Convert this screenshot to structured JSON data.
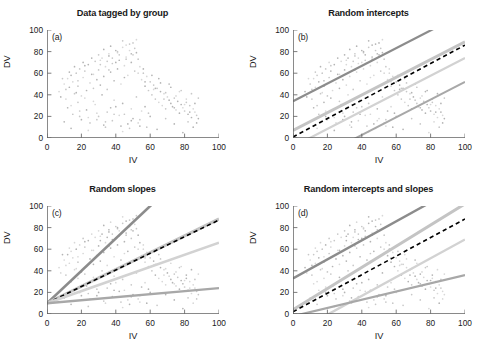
{
  "figure": {
    "width": 491,
    "height": 352,
    "background": "#ffffff"
  },
  "axes": {
    "xlabel": "IV",
    "ylabel": "DV",
    "xticks": [
      0,
      20,
      40,
      60,
      80,
      100
    ],
    "yticks": [
      0,
      20,
      40,
      60,
      80,
      100
    ],
    "xlim": [
      0,
      100
    ],
    "ylim": [
      0,
      100
    ],
    "grid": false
  },
  "colors": {
    "axis": "#5a5a5a",
    "text": "#1a1a1a",
    "pooled_line": "#000000",
    "group_dark": "#8c8c8c",
    "group_mid": "#a8a8a8",
    "group_light": "#c4c4c4",
    "group_lighter": "#d2d2d2",
    "point_dark": "#b4b4b4",
    "point_light": "#d8d8d8"
  },
  "panels": [
    {
      "key": "a",
      "tag": "(a)",
      "title": "Data tagged by group",
      "has_points": true,
      "lines": []
    },
    {
      "key": "b",
      "tag": "(b)",
      "title": "Random intercepts",
      "has_points": true,
      "lines": [
        {
          "name": "group-1",
          "intercept": 34,
          "slope": 0.82,
          "color": "#8c8c8c",
          "width": 2.2,
          "dashed": false
        },
        {
          "name": "group-2",
          "intercept": 7,
          "slope": 0.82,
          "color": "#c4c4c4",
          "width": 3.0,
          "dashed": false
        },
        {
          "name": "pooled",
          "intercept": 1,
          "slope": 0.85,
          "color": "#000000",
          "width": 1.6,
          "dashed": true
        },
        {
          "name": "group-3",
          "intercept": -8,
          "slope": 0.82,
          "color": "#d2d2d2",
          "width": 2.2,
          "dashed": false
        },
        {
          "name": "group-4",
          "intercept": -30,
          "slope": 0.82,
          "color": "#a8a8a8",
          "width": 2.0,
          "dashed": false
        }
      ]
    },
    {
      "key": "c",
      "tag": "(c)",
      "title": "Random slopes",
      "has_points": true,
      "lines": [
        {
          "name": "group-1",
          "intercept": 10,
          "slope": 1.5,
          "color": "#8c8c8c",
          "width": 2.6,
          "dashed": false
        },
        {
          "name": "group-2",
          "intercept": 10,
          "slope": 0.78,
          "color": "#c4c4c4",
          "width": 3.0,
          "dashed": false
        },
        {
          "name": "pooled",
          "intercept": 10,
          "slope": 0.77,
          "color": "#000000",
          "width": 1.6,
          "dashed": true
        },
        {
          "name": "group-3",
          "intercept": 10,
          "slope": 0.56,
          "color": "#d2d2d2",
          "width": 2.6,
          "dashed": false
        },
        {
          "name": "group-4",
          "intercept": 10,
          "slope": 0.14,
          "color": "#a8a8a8",
          "width": 2.4,
          "dashed": false
        }
      ]
    },
    {
      "key": "d",
      "tag": "(d)",
      "title": "Random intercepts and slopes",
      "has_points": true,
      "lines": [
        {
          "name": "group-1",
          "intercept": 33,
          "slope": 0.88,
          "color": "#8c8c8c",
          "width": 2.4,
          "dashed": false
        },
        {
          "name": "group-2",
          "intercept": 4,
          "slope": 0.98,
          "color": "#c4c4c4",
          "width": 3.0,
          "dashed": false
        },
        {
          "name": "pooled",
          "intercept": 2,
          "slope": 0.86,
          "color": "#000000",
          "width": 1.6,
          "dashed": true
        },
        {
          "name": "group-3",
          "intercept": -18,
          "slope": 0.87,
          "color": "#d2d2d2",
          "width": 2.4,
          "dashed": false
        },
        {
          "name": "group-4",
          "intercept": -2,
          "slope": 0.38,
          "color": "#a8a8a8",
          "width": 2.2,
          "dashed": false
        }
      ]
    }
  ],
  "chart_data": {
    "type": "scatter",
    "xlabel": "IV",
    "ylabel": "DV",
    "xlim": [
      0,
      100
    ],
    "ylim": [
      0,
      100
    ],
    "xticks": [
      0,
      20,
      40,
      60,
      80,
      100
    ],
    "yticks": [
      0,
      20,
      40,
      60,
      80,
      100
    ],
    "grid": false,
    "legend": "none",
    "subplots": [
      {
        "panel": "(a)",
        "title": "Data tagged by group",
        "series": [
          {
            "name": "observations",
            "type": "scatter",
            "n_points": 300
          }
        ]
      },
      {
        "panel": "(b)",
        "title": "Random intercepts",
        "series": [
          {
            "name": "group 1",
            "type": "line",
            "intercept": 34,
            "slope": 0.82
          },
          {
            "name": "group 2",
            "type": "line",
            "intercept": 7,
            "slope": 0.82
          },
          {
            "name": "pooled (dashed)",
            "type": "line",
            "intercept": 1,
            "slope": 0.85
          },
          {
            "name": "group 3",
            "type": "line",
            "intercept": -8,
            "slope": 0.82
          },
          {
            "name": "group 4",
            "type": "line",
            "intercept": -30,
            "slope": 0.82
          }
        ]
      },
      {
        "panel": "(c)",
        "title": "Random slopes",
        "series": [
          {
            "name": "group 1",
            "type": "line",
            "intercept": 10,
            "slope": 1.5
          },
          {
            "name": "group 2",
            "type": "line",
            "intercept": 10,
            "slope": 0.78
          },
          {
            "name": "pooled (dashed)",
            "type": "line",
            "intercept": 10,
            "slope": 0.77
          },
          {
            "name": "group 3",
            "type": "line",
            "intercept": 10,
            "slope": 0.56
          },
          {
            "name": "group 4",
            "type": "line",
            "intercept": 10,
            "slope": 0.14
          }
        ]
      },
      {
        "panel": "(d)",
        "title": "Random intercepts and slopes",
        "series": [
          {
            "name": "group 1",
            "type": "line",
            "intercept": 33,
            "slope": 0.88
          },
          {
            "name": "group 2",
            "type": "line",
            "intercept": 4,
            "slope": 0.98
          },
          {
            "name": "pooled (dashed)",
            "type": "line",
            "intercept": 2,
            "slope": 0.86
          },
          {
            "name": "group 3",
            "type": "line",
            "intercept": -18,
            "slope": 0.87
          },
          {
            "name": "group 4",
            "type": "line",
            "intercept": -2,
            "slope": 0.38
          }
        ]
      }
    ],
    "points": [
      [
        7,
        43
      ],
      [
        10,
        50
      ],
      [
        11,
        36
      ],
      [
        12,
        55
      ],
      [
        13,
        47
      ],
      [
        14,
        58
      ],
      [
        15,
        52
      ],
      [
        16,
        41
      ],
      [
        17,
        60
      ],
      [
        18,
        48
      ],
      [
        19,
        64
      ],
      [
        20,
        39
      ],
      [
        21,
        56
      ],
      [
        22,
        62
      ],
      [
        23,
        44
      ],
      [
        24,
        68
      ],
      [
        25,
        51
      ],
      [
        26,
        59
      ],
      [
        27,
        46
      ],
      [
        28,
        71
      ],
      [
        29,
        54
      ],
      [
        30,
        63
      ],
      [
        31,
        49
      ],
      [
        32,
        74
      ],
      [
        33,
        57
      ],
      [
        34,
        66
      ],
      [
        35,
        45
      ],
      [
        36,
        78
      ],
      [
        37,
        61
      ],
      [
        38,
        69
      ],
      [
        39,
        53
      ],
      [
        40,
        81
      ],
      [
        41,
        64
      ],
      [
        42,
        72
      ],
      [
        43,
        50
      ],
      [
        44,
        84
      ],
      [
        45,
        67
      ],
      [
        46,
        75
      ],
      [
        47,
        58
      ],
      [
        48,
        87
      ],
      [
        49,
        70
      ],
      [
        50,
        77
      ],
      [
        51,
        62
      ],
      [
        52,
        91
      ],
      [
        53,
        73
      ],
      [
        54,
        66
      ],
      [
        55,
        54
      ],
      [
        56,
        60
      ],
      [
        57,
        48
      ],
      [
        58,
        57
      ],
      [
        59,
        44
      ],
      [
        60,
        52
      ],
      [
        61,
        40
      ],
      [
        62,
        49
      ],
      [
        63,
        36
      ],
      [
        64,
        46
      ],
      [
        65,
        33
      ],
      [
        66,
        43
      ],
      [
        67,
        30
      ],
      [
        68,
        41
      ],
      [
        69,
        27
      ],
      [
        70,
        38
      ],
      [
        71,
        35
      ],
      [
        72,
        32
      ],
      [
        73,
        29
      ],
      [
        74,
        37
      ],
      [
        75,
        26
      ],
      [
        76,
        34
      ],
      [
        77,
        23
      ],
      [
        78,
        31
      ],
      [
        79,
        28
      ],
      [
        80,
        25
      ],
      [
        81,
        33
      ],
      [
        82,
        22
      ],
      [
        83,
        30
      ],
      [
        84,
        19
      ],
      [
        85,
        27
      ],
      [
        86,
        24
      ],
      [
        87,
        21
      ],
      [
        88,
        18
      ],
      [
        12,
        28
      ],
      [
        15,
        22
      ],
      [
        18,
        33
      ],
      [
        20,
        17
      ],
      [
        23,
        26
      ],
      [
        25,
        14
      ],
      [
        28,
        31
      ],
      [
        30,
        20
      ],
      [
        33,
        12
      ],
      [
        35,
        24
      ],
      [
        38,
        16
      ],
      [
        40,
        29
      ],
      [
        43,
        11
      ],
      [
        45,
        22
      ],
      [
        48,
        9
      ],
      [
        50,
        18
      ],
      [
        53,
        14
      ],
      [
        55,
        25
      ],
      [
        58,
        10
      ],
      [
        60,
        20
      ],
      [
        8,
        38
      ],
      [
        11,
        45
      ],
      [
        14,
        30
      ],
      [
        17,
        42
      ],
      [
        19,
        25
      ],
      [
        22,
        37
      ],
      [
        24,
        19
      ],
      [
        27,
        34
      ],
      [
        29,
        23
      ],
      [
        32,
        40
      ],
      [
        34,
        15
      ],
      [
        37,
        28
      ],
      [
        39,
        35
      ],
      [
        42,
        21
      ],
      [
        44,
        32
      ],
      [
        47,
        13
      ],
      [
        49,
        27
      ],
      [
        52,
        38
      ],
      [
        54,
        17
      ],
      [
        57,
        29
      ],
      [
        16,
        66
      ],
      [
        21,
        70
      ],
      [
        26,
        74
      ],
      [
        31,
        68
      ],
      [
        36,
        76
      ],
      [
        41,
        79
      ],
      [
        46,
        73
      ],
      [
        51,
        83
      ],
      [
        56,
        64
      ],
      [
        61,
        58
      ],
      [
        63,
        46
      ],
      [
        66,
        51
      ],
      [
        69,
        42
      ],
      [
        72,
        47
      ],
      [
        75,
        39
      ],
      [
        78,
        44
      ],
      [
        81,
        36
      ],
      [
        84,
        41
      ],
      [
        86,
        32
      ],
      [
        88,
        37
      ],
      [
        9,
        55
      ],
      [
        13,
        61
      ],
      [
        18,
        53
      ],
      [
        22,
        67
      ],
      [
        27,
        59
      ],
      [
        31,
        72
      ],
      [
        36,
        63
      ],
      [
        40,
        70
      ],
      [
        45,
        56
      ],
      [
        49,
        78
      ],
      [
        53,
        60
      ],
      [
        57,
        52
      ],
      [
        62,
        45
      ],
      [
        65,
        55
      ],
      [
        68,
        36
      ],
      [
        71,
        50
      ],
      [
        74,
        28
      ],
      [
        77,
        43
      ],
      [
        80,
        31
      ],
      [
        83,
        24
      ],
      [
        10,
        15
      ],
      [
        14,
        9
      ],
      [
        19,
        20
      ],
      [
        24,
        7
      ],
      [
        29,
        17
      ],
      [
        34,
        10
      ],
      [
        39,
        22
      ],
      [
        44,
        6
      ],
      [
        49,
        16
      ],
      [
        54,
        11
      ],
      [
        59,
        23
      ],
      [
        64,
        8
      ],
      [
        69,
        18
      ],
      [
        74,
        13
      ],
      [
        79,
        5
      ],
      [
        82,
        15
      ],
      [
        85,
        10
      ],
      [
        87,
        14
      ],
      [
        44,
        90
      ],
      [
        50,
        88
      ],
      [
        33,
        82
      ],
      [
        37,
        85
      ],
      [
        41,
        80
      ],
      [
        46,
        86
      ],
      [
        52,
        79
      ],
      [
        38,
        74
      ],
      [
        42,
        77
      ],
      [
        48,
        81
      ],
      [
        30,
        77
      ],
      [
        35,
        71
      ]
    ]
  }
}
